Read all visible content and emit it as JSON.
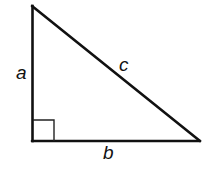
{
  "diagram": {
    "type": "right-triangle",
    "stroke_color": "#111111",
    "background": "#ffffff",
    "vertices": {
      "top": [
        32,
        6
      ],
      "right_angle": [
        32,
        141
      ],
      "right": [
        200,
        141
      ]
    },
    "right_angle_marker": {
      "x": 33,
      "y": 120,
      "size": 21
    },
    "labels": {
      "side_a": "a",
      "side_b": "b",
      "side_c": "c"
    }
  }
}
